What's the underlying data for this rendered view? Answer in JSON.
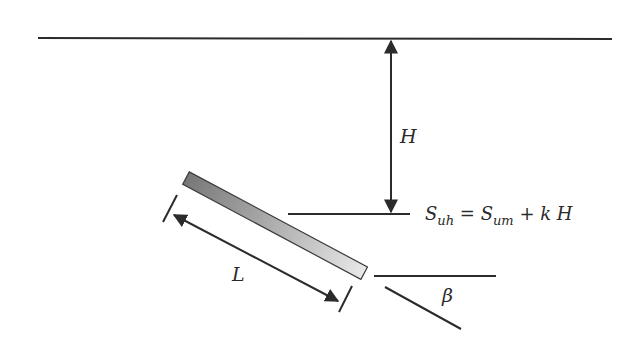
{
  "diagram": {
    "type": "inclined pile / anchor geometry",
    "labels": {
      "depth": "H",
      "length": "L",
      "angle": "β",
      "equation": {
        "lhs_main": "S",
        "lhs_sub": "uh",
        "equals": " = ",
        "rhs_main": "S",
        "rhs_sub": "um",
        "plus_term": " + k H"
      }
    },
    "colors": {
      "line": "#2b2b2b",
      "pile_dark": "#7a7a7a",
      "pile_light": "#e6e6e6",
      "background": "#ffffff"
    }
  }
}
